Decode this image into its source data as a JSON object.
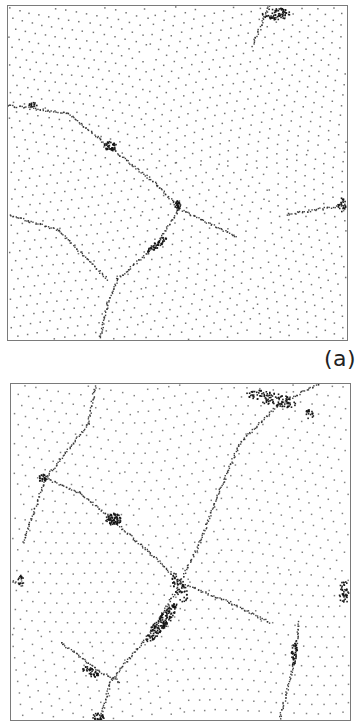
{
  "figure": {
    "panels": [
      {
        "id": "a",
        "label": "(a)",
        "seed": 11,
        "spacing": 10.5,
        "dot_color": "#5a5a5a",
        "grains": [
          {
            "cx": 60,
            "cy": 60,
            "angle": 4,
            "curl": 0.0016
          },
          {
            "cx": 220,
            "cy": 70,
            "angle": -8,
            "curl": -0.0022
          },
          {
            "cx": 300,
            "cy": 260,
            "angle": 14,
            "curl": 0.0018
          },
          {
            "cx": 60,
            "cy": 250,
            "angle": -3,
            "curl": -0.0012
          },
          {
            "cx": 210,
            "cy": 250,
            "angle": 30,
            "curl": 0.0025
          }
        ],
        "boundaries": [
          [
            [
              263,
              0
            ],
            [
              246,
              40
            ]
          ],
          [
            [
              0,
              100
            ],
            [
              60,
              108
            ],
            [
              100,
              140
            ],
            [
              150,
              180
            ],
            [
              172,
              204
            ],
            [
              230,
              232
            ]
          ],
          [
            [
              172,
              204
            ],
            [
              150,
              240
            ],
            [
              110,
              275
            ],
            [
              100,
              300
            ],
            [
              92,
              336
            ]
          ],
          [
            [
              0,
              210
            ],
            [
              50,
              225
            ],
            [
              100,
              275
            ]
          ],
          [
            [
              280,
              210
            ],
            [
              341,
              200
            ]
          ]
        ],
        "clusters": [
          {
            "x": 270,
            "y": 8,
            "rx": 14,
            "ry": 6,
            "n": 70
          },
          {
            "x": 103,
            "y": 141,
            "rx": 6,
            "ry": 5,
            "n": 40
          },
          {
            "x": 171,
            "y": 201,
            "rx": 3,
            "ry": 5,
            "n": 28
          },
          {
            "x": 150,
            "y": 240,
            "rx": 12,
            "ry": 3,
            "n": 45,
            "rot": -38
          },
          {
            "x": 336,
            "y": 200,
            "rx": 4,
            "ry": 7,
            "n": 22
          },
          {
            "x": 25,
            "y": 100,
            "rx": 4,
            "ry": 3,
            "n": 14
          }
        ]
      },
      {
        "id": "b",
        "label": "",
        "seed": 29,
        "spacing": 11.5,
        "dot_color": "#6a6a6a",
        "grains": [
          {
            "cx": 60,
            "cy": 40,
            "angle": 6,
            "curl": 0.0012
          },
          {
            "cx": 180,
            "cy": 60,
            "angle": -20,
            "curl": 0.003
          },
          {
            "cx": 300,
            "cy": 120,
            "angle": 22,
            "curl": -0.0024
          },
          {
            "cx": 80,
            "cy": 200,
            "angle": -4,
            "curl": 0.0014
          },
          {
            "cx": 260,
            "cy": 260,
            "angle": 10,
            "curl": -0.0016
          },
          {
            "cx": 60,
            "cy": 320,
            "angle": 18,
            "curl": 0.001
          }
        ],
        "boundaries": [
          [
            [
              85,
              0
            ],
            [
              78,
              40
            ],
            [
              35,
              95
            ],
            [
              12,
              160
            ]
          ],
          [
            [
              35,
              95
            ],
            [
              70,
              110
            ],
            [
              100,
              135
            ],
            [
              140,
              170
            ],
            [
              170,
              200
            ]
          ],
          [
            [
              310,
              0
            ],
            [
              270,
              20
            ],
            [
              230,
              60
            ],
            [
              205,
              120
            ],
            [
              190,
              160
            ],
            [
              170,
              200
            ]
          ],
          [
            [
              170,
              200
            ],
            [
              145,
              245
            ],
            [
              120,
              275
            ],
            [
              100,
              300
            ],
            [
              90,
              338
            ]
          ],
          [
            [
              170,
              200
            ],
            [
              220,
              220
            ],
            [
              260,
              240
            ]
          ],
          [
            [
              290,
              240
            ],
            [
              285,
              280
            ],
            [
              270,
              338
            ]
          ],
          [
            [
              50,
              260
            ],
            [
              90,
              290
            ],
            [
              110,
              300
            ]
          ],
          [
            [
              0,
              198
            ],
            [
              12,
              203
            ]
          ]
        ],
        "clusters": [
          {
            "x": 262,
            "y": 15,
            "rx": 26,
            "ry": 7,
            "n": 110,
            "rot": 12
          },
          {
            "x": 300,
            "y": 30,
            "rx": 5,
            "ry": 5,
            "n": 18
          },
          {
            "x": 32,
            "y": 95,
            "rx": 4,
            "ry": 5,
            "n": 24
          },
          {
            "x": 103,
            "y": 136,
            "rx": 8,
            "ry": 6,
            "n": 70
          },
          {
            "x": 335,
            "y": 210,
            "rx": 5,
            "ry": 12,
            "n": 40
          },
          {
            "x": 152,
            "y": 240,
            "rx": 24,
            "ry": 6,
            "n": 150,
            "rot": -52
          },
          {
            "x": 170,
            "y": 205,
            "rx": 6,
            "ry": 16,
            "n": 50,
            "rot": -20
          },
          {
            "x": 80,
            "y": 290,
            "rx": 10,
            "ry": 4,
            "n": 40,
            "rot": 30
          },
          {
            "x": 88,
            "y": 335,
            "rx": 6,
            "ry": 4,
            "n": 30
          },
          {
            "x": 285,
            "y": 270,
            "rx": 3,
            "ry": 14,
            "n": 36,
            "rot": 8
          },
          {
            "x": 10,
            "y": 198,
            "rx": 3,
            "ry": 6,
            "n": 14
          }
        ]
      }
    ]
  }
}
